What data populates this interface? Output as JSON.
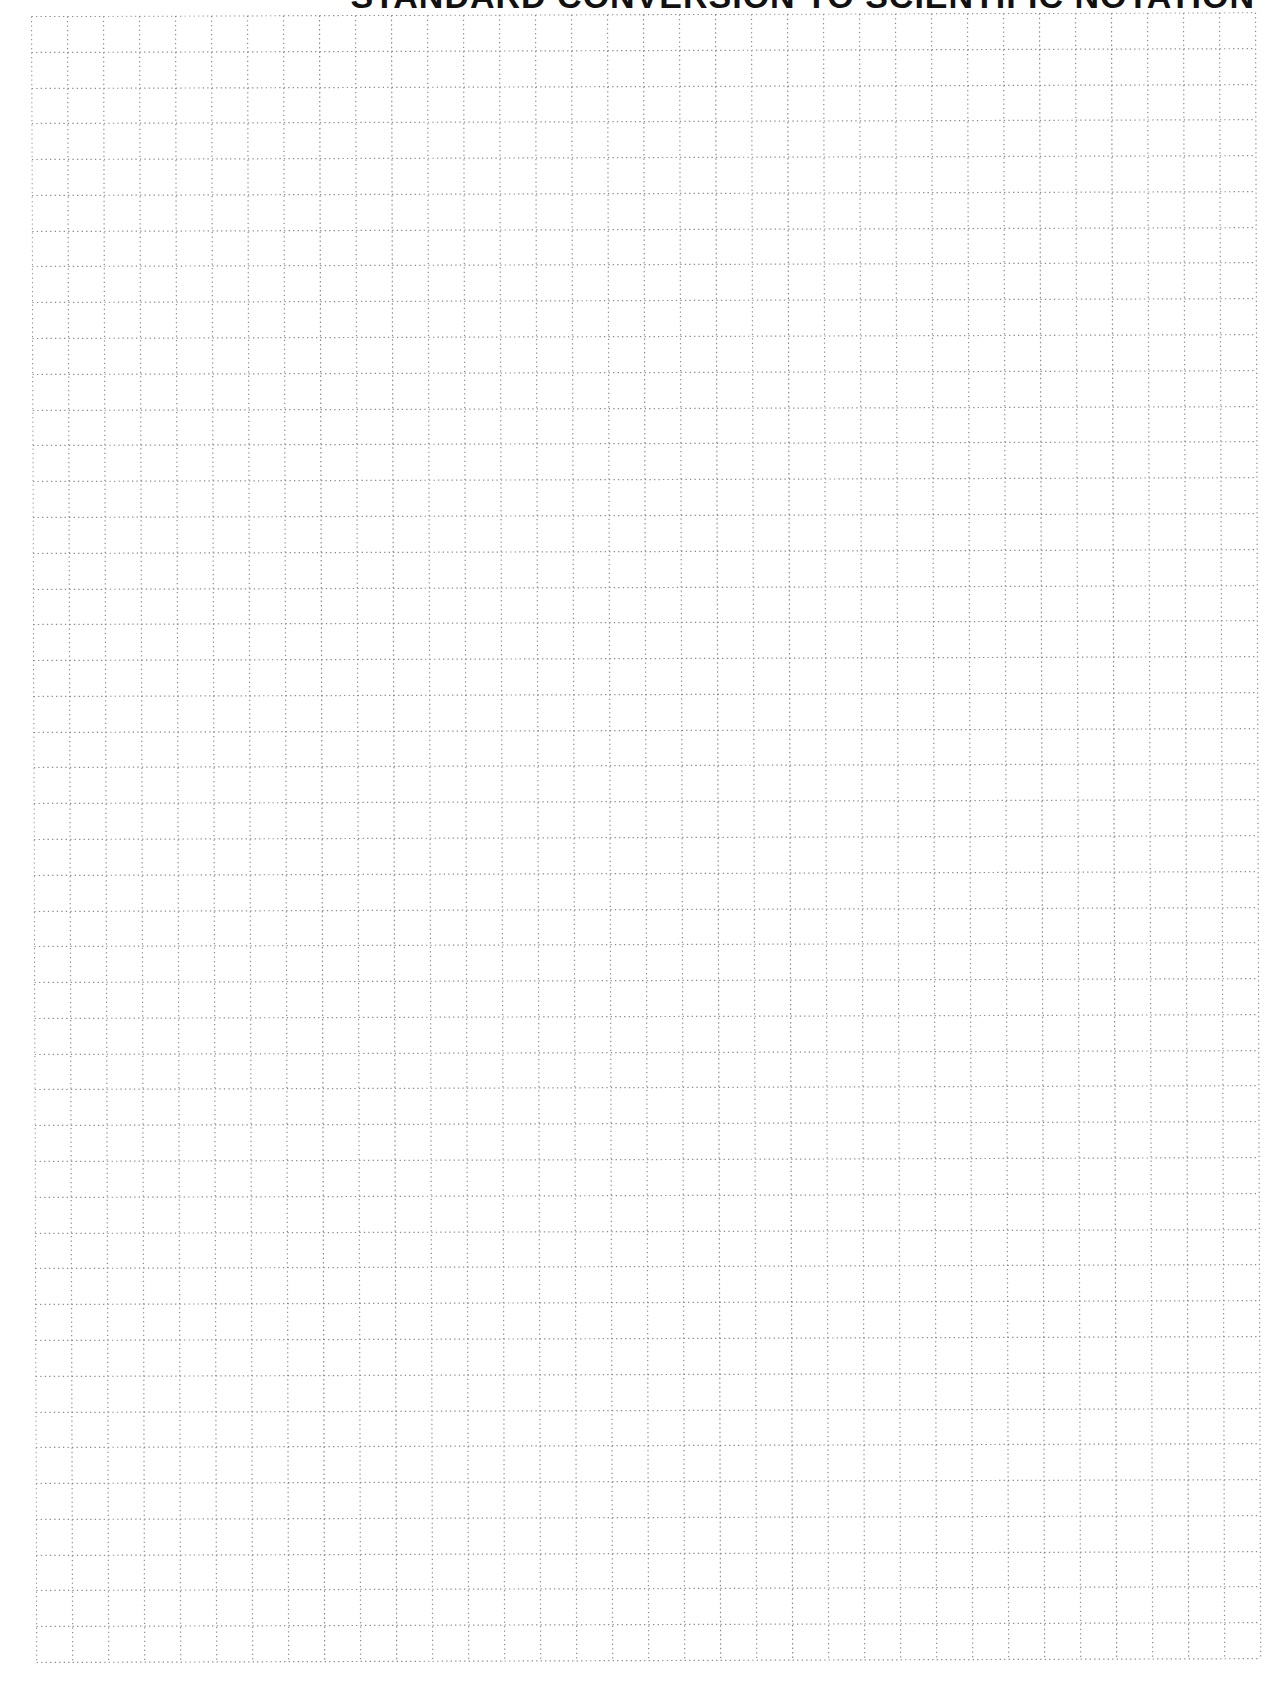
{
  "document": {
    "title": "STANDARD CONVERSION TO SCIENTIFIC NOTATION",
    "title_visible_fragment": "ARD CONVERSION TO SCIENTIFIC NOTATION"
  },
  "grid": {
    "columns": 34,
    "rows": 46,
    "cell_size_px": 36,
    "line_style": "dotted",
    "line_color": "#8a8a8a",
    "background": "#ffffff"
  }
}
